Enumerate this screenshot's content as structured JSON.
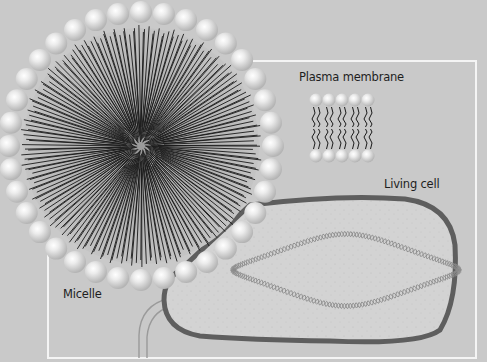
{
  "figure": {
    "type": "biology-illustration"
  },
  "labels": {
    "plasma_membrane": "Plasma membrane",
    "living_cell": "Living cell",
    "micelle": "Micelle"
  },
  "colors": {
    "background": "#c9c9c9",
    "frame": "#f4f4f4",
    "cell_fill": "#d2d2d2",
    "cell_membrane": "#5e5e5e",
    "lipid_head": "#e4e4e4",
    "lipid_tail": "#1a1a1a",
    "dna": "#8a8a8a"
  },
  "micelle": {
    "center": [
      141,
      146
    ],
    "bead_ring_radius": 132,
    "bead_count": 36,
    "bead_radius": 11
  },
  "bilayer_diagram": {
    "phospholipid_count": 5
  }
}
